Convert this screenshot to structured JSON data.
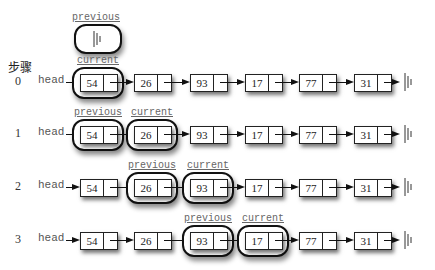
{
  "title": "步骤",
  "head_label": "head",
  "labels": {
    "previous": "previous",
    "current": "current"
  },
  "initial_previous": {
    "label": "previous",
    "value": "None (ground)"
  },
  "nodes": [
    "54",
    "26",
    "93",
    "17",
    "77",
    "31"
  ],
  "steps": [
    {
      "num": "0",
      "previous": null,
      "current": 0
    },
    {
      "num": "1",
      "previous": 0,
      "current": 1
    },
    {
      "num": "2",
      "previous": 1,
      "current": 2
    },
    {
      "num": "3",
      "previous": 2,
      "current": 3
    }
  ]
}
